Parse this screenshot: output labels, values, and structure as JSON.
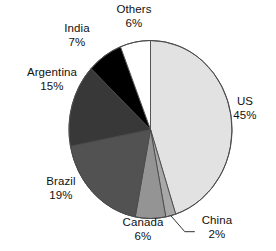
{
  "chart_data": {
    "type": "pie",
    "title": "",
    "subtitle": "",
    "xlabel": "",
    "ylabel": "",
    "grid": false,
    "legend_position": "none",
    "label_format": "name + percent",
    "start_angle_deg": 0,
    "direction": "clockwise",
    "units": "percent",
    "categories": [
      "US",
      "China",
      "Canada",
      "Brazil",
      "Argentina",
      "India",
      "Others"
    ],
    "values": [
      45,
      2,
      6,
      19,
      15,
      7,
      6
    ],
    "colors": [
      "#e2e2e2",
      "#a8a8a8",
      "#949494",
      "#525252",
      "#383838",
      "#000000",
      "#ffffff"
    ],
    "slices": [
      {
        "name": "US",
        "value": 45,
        "percent_label": "45%",
        "color": "#e2e2e2",
        "leader_line": false
      },
      {
        "name": "China",
        "value": 2,
        "percent_label": "2%",
        "color": "#a8a8a8",
        "leader_line": true
      },
      {
        "name": "Canada",
        "value": 6,
        "percent_label": "6%",
        "color": "#949494",
        "leader_line": false
      },
      {
        "name": "Brazil",
        "value": 19,
        "percent_label": "19%",
        "color": "#525252",
        "leader_line": false
      },
      {
        "name": "Argentina",
        "value": 15,
        "percent_label": "15%",
        "color": "#383838",
        "leader_line": false
      },
      {
        "name": "India",
        "value": 7,
        "percent_label": "7%",
        "color": "#000000",
        "leader_line": false
      },
      {
        "name": "Others",
        "value": 6,
        "percent_label": "6%",
        "color": "#ffffff",
        "leader_line": false
      }
    ]
  },
  "labels": {
    "us": {
      "name": "US",
      "pct": "45%"
    },
    "china": {
      "name": "China",
      "pct": "2%"
    },
    "canada": {
      "name": "Canada",
      "pct": "6%"
    },
    "brazil": {
      "name": "Brazil",
      "pct": "19%"
    },
    "argentina": {
      "name": "Argentina",
      "pct": "15%"
    },
    "india": {
      "name": "India",
      "pct": "7%"
    },
    "others": {
      "name": "Others",
      "pct": "6%"
    }
  }
}
